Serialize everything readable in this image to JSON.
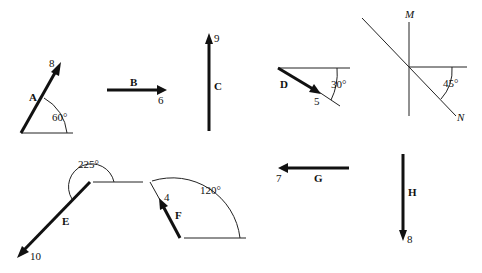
{
  "diagram": {
    "type": "vector-diagram",
    "vectors": [
      {
        "name": "A",
        "magnitude": "8",
        "angle_label": "60°"
      },
      {
        "name": "B",
        "magnitude": "6"
      },
      {
        "name": "C",
        "magnitude": "9"
      },
      {
        "name": "D",
        "magnitude": "5",
        "angle_label": "30°"
      },
      {
        "name": "E",
        "magnitude": "10",
        "angle_label": "225°"
      },
      {
        "name": "F",
        "magnitude": "4",
        "angle_label": "120°"
      },
      {
        "name": "G",
        "magnitude": "7"
      },
      {
        "name": "H",
        "magnitude": "8"
      }
    ],
    "axes_MN": {
      "m_label": "M",
      "n_label": "N",
      "angle_label": "45°"
    }
  }
}
